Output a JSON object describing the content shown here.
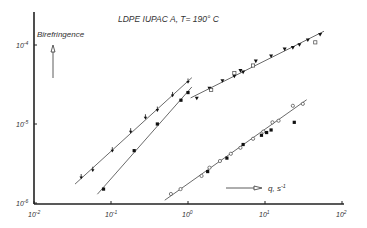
{
  "chart_data": {
    "type": "scatter",
    "title": "LDPE IUPAC A, T= 190° C",
    "xlabel": "q, s -1",
    "ylabel": "Birefringence",
    "xscale": "log",
    "yscale": "log",
    "xlim": [
      0.01,
      100
    ],
    "ylim": [
      1e-06,
      0.0002
    ],
    "x_ticks": [
      "10-2",
      "10-1",
      "10 0",
      "10 1",
      "10 2"
    ],
    "y_ticks": [
      "10-6",
      "10-5",
      "10-4"
    ],
    "grid": false,
    "legend": "none",
    "series": [
      {
        "name": "series-a-arrow-markers",
        "marker": "filled-arrow",
        "x": [
          0.041,
          0.058,
          0.104,
          0.18,
          0.28,
          0.4,
          0.63,
          1.0
        ],
        "y": [
          2.1e-06,
          2.6e-06,
          4.6e-06,
          8e-06,
          1.2e-05,
          1.5e-05,
          2.3e-05,
          3.4e-05
        ],
        "fit_line": true
      },
      {
        "name": "series-b-filled-circles",
        "marker": "filled-circle",
        "x": [
          0.08,
          0.2,
          0.4,
          0.81,
          1.0
        ],
        "y": [
          1.5e-06,
          4.6e-06,
          1e-05,
          2e-05,
          2.5e-05
        ],
        "fit_line": true
      },
      {
        "name": "series-c-filled-inverted-triangles",
        "marker": "filled-triangle-down",
        "x": [
          1.3,
          1.9,
          2.8,
          4.0,
          4.8,
          5.2,
          7.6,
          12.0,
          18.0,
          23.0,
          28.0,
          36.0,
          52.0
        ],
        "y": [
          2.1e-05,
          2.8e-05,
          3.5e-05,
          4e-05,
          4.7e-05,
          4.5e-05,
          6.2e-05,
          7.2e-05,
          8.8e-05,
          9.2e-05,
          0.0001,
          0.000115,
          0.000135
        ],
        "fit_line": true
      },
      {
        "name": "series-c-open-squares",
        "marker": "open-square",
        "x": [
          2.0,
          4.0,
          7.0,
          45.0
        ],
        "y": [
          2.7e-05,
          4.4e-05,
          5.5e-05,
          0.000108
        ]
      },
      {
        "name": "series-d-open-circles",
        "marker": "open-circle",
        "x": [
          0.6,
          0.8,
          1.5,
          1.9,
          2.6,
          3.6,
          4.8,
          7.0,
          9.5,
          12.5,
          15.0,
          23.0,
          31.0
        ],
        "y": [
          1.3e-06,
          1.5e-06,
          2.2e-06,
          2.8e-06,
          3.4e-06,
          4.2e-06,
          5e-06,
          6.5e-06,
          8e-06,
          1.05e-05,
          1.1e-05,
          1.7e-05,
          1.8e-05
        ],
        "fit_line": true
      },
      {
        "name": "series-d-filled-circles",
        "marker": "filled-circle",
        "x": [
          1.8,
          3.2,
          5.2,
          9.0,
          10.5,
          12.0,
          24.0
        ],
        "y": [
          2.5e-06,
          3.7e-06,
          5.5e-06,
          7.2e-06,
          7.8e-06,
          8.4e-06,
          1.05e-05
        ]
      }
    ]
  },
  "labels": {
    "title": "LDPE IUPAC A, T= 190° C",
    "ylabel": "Birefringence",
    "xlabel": "q, s",
    "xlabel_exp": "-1",
    "xtick_bases": [
      "10",
      "10",
      "10",
      "10",
      "10"
    ],
    "xtick_exps": [
      "-2",
      "-1",
      "0",
      "1",
      "2"
    ],
    "ytick_bases": [
      "10",
      "10",
      "10"
    ],
    "ytick_exps": [
      "-6",
      "-5",
      "-4"
    ]
  }
}
